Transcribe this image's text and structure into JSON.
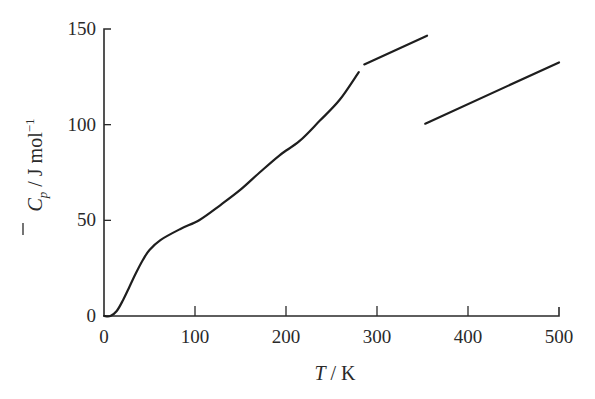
{
  "chart_data": {
    "type": "line",
    "title": "",
    "xlabel": {
      "italic": "T",
      "rest": " / K"
    },
    "ylabel": {
      "symbol": "C",
      "subscript": "p",
      "rest": " / J  mol",
      "superscript": "−1"
    },
    "xlim": [
      0,
      500
    ],
    "ylim": [
      0,
      150
    ],
    "xticks": [
      0,
      100,
      200,
      300,
      400,
      500
    ],
    "yticks": [
      0,
      50,
      100,
      150
    ],
    "xtick_labels": [
      "0",
      "100",
      "200",
      "300",
      "400",
      "500"
    ],
    "ytick_labels": [
      "0",
      "50",
      "100",
      "150"
    ],
    "grid": false,
    "legend": null,
    "series": [
      {
        "name": "segment-1",
        "points": [
          [
            0,
            0
          ],
          [
            7,
            0
          ],
          [
            14,
            2.6
          ],
          [
            21,
            8.4
          ],
          [
            28,
            15.3
          ],
          [
            35,
            22.3
          ],
          [
            43,
            29.5
          ],
          [
            50,
            34.5
          ],
          [
            62,
            39.7
          ],
          [
            84,
            45.5
          ],
          [
            105,
            50.2
          ],
          [
            128,
            58
          ],
          [
            150,
            66
          ],
          [
            171,
            75
          ],
          [
            193,
            84
          ],
          [
            215,
            91.5
          ],
          [
            237,
            102
          ],
          [
            259,
            113
          ],
          [
            280,
            127.5
          ]
        ]
      },
      {
        "name": "segment-2",
        "points": [
          [
            286,
            131.5
          ],
          [
            355,
            146.5
          ]
        ]
      },
      {
        "name": "segment-3",
        "points": [
          [
            353,
            100.5
          ],
          [
            500,
            132.5
          ]
        ]
      }
    ]
  }
}
